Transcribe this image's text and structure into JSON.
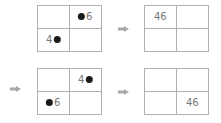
{
  "panels": [
    {
      "id": "p1",
      "cells": {
        "tl": {
          "left": "",
          "dot": false,
          "right": ""
        },
        "tr": {
          "left": "",
          "dot": true,
          "right": "6"
        },
        "bl": {
          "left": "4",
          "dot": true,
          "right": ""
        },
        "br": {
          "left": "",
          "dot": false,
          "right": ""
        }
      }
    },
    {
      "id": "p2",
      "cells": {
        "tl": {
          "text": "46"
        },
        "tr": {
          "text": ""
        },
        "bl": {
          "text": ""
        },
        "br": {
          "text": ""
        }
      }
    },
    {
      "id": "p3",
      "cells": {
        "tl": {
          "left": "",
          "dot": false,
          "right": ""
        },
        "tr": {
          "left": "4",
          "dot": true,
          "right": ""
        },
        "bl": {
          "left": "",
          "dot": true,
          "right": "6"
        },
        "br": {
          "left": "",
          "dot": false,
          "right": ""
        }
      }
    },
    {
      "id": "p4",
      "cells": {
        "tl": {
          "text": ""
        },
        "tr": {
          "text": ""
        },
        "bl": {
          "text": ""
        },
        "br": {
          "text": "46"
        }
      }
    }
  ],
  "arrows": [
    "right-arrow",
    "right-arrow",
    "right-arrow"
  ],
  "colors": {
    "grid_line": "#b0b0b0",
    "text": "#777777",
    "dot": "#1a1a1a",
    "arrow": "#a8a8a8"
  }
}
